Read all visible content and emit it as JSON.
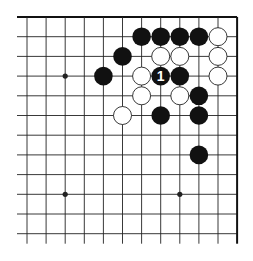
{
  "diagram": {
    "type": "go-board-corner",
    "grid": {
      "columns": 12,
      "rows": 12,
      "x0": 27,
      "y0": 17,
      "dx": 19.1,
      "dy": 19.7,
      "line_color": "#222222",
      "border_color": "#111111",
      "border_edges": [
        "top",
        "right"
      ],
      "extend_left": 10,
      "extend_bottom": 10
    },
    "star_points": [
      {
        "col": 2,
        "row": 3
      },
      {
        "col": 2,
        "row": 9
      },
      {
        "col": 8,
        "row": 9
      }
    ],
    "stones": [
      {
        "color": "black",
        "col": 6,
        "row": 1
      },
      {
        "color": "black",
        "col": 7,
        "row": 1
      },
      {
        "color": "black",
        "col": 8,
        "row": 1
      },
      {
        "color": "black",
        "col": 9,
        "row": 1
      },
      {
        "color": "white",
        "col": 10,
        "row": 1
      },
      {
        "color": "black",
        "col": 5,
        "row": 2
      },
      {
        "color": "white",
        "col": 7,
        "row": 2
      },
      {
        "color": "white",
        "col": 8,
        "row": 2
      },
      {
        "color": "white",
        "col": 10,
        "row": 2
      },
      {
        "color": "black",
        "col": 4,
        "row": 3
      },
      {
        "color": "white",
        "col": 6,
        "row": 3
      },
      {
        "color": "black",
        "col": 7,
        "row": 3,
        "label": "1"
      },
      {
        "color": "black",
        "col": 8,
        "row": 3
      },
      {
        "color": "white",
        "col": 10,
        "row": 3
      },
      {
        "color": "white",
        "col": 6,
        "row": 4
      },
      {
        "color": "white",
        "col": 8,
        "row": 4
      },
      {
        "color": "black",
        "col": 9,
        "row": 4
      },
      {
        "color": "white",
        "col": 5,
        "row": 5
      },
      {
        "color": "black",
        "col": 7,
        "row": 5
      },
      {
        "color": "black",
        "col": 9,
        "row": 5
      },
      {
        "color": "black",
        "col": 9,
        "row": 7
      }
    ],
    "colors": {
      "black_stone": "#111111",
      "white_stone": "#ffffff",
      "white_stone_outline": "#222222",
      "label_on_black": "#ffffff"
    }
  }
}
